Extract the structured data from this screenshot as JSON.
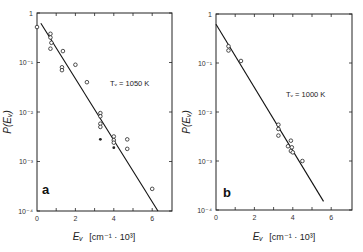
{
  "chart_data": [
    {
      "type": "scatter",
      "panel": "a",
      "annotation": "T_v = 1050 K",
      "xlabel": "E_v [cm^-1 · 10^3]",
      "ylabel": "P(E_v)",
      "xlim": [
        0,
        7
      ],
      "ylim": [
        0.0001,
        1
      ],
      "yscale": "log",
      "x_ticks": [
        "0",
        "2",
        "4",
        "6"
      ],
      "y_ticks": [
        "1",
        "10^-1",
        "10^-2",
        "10^-3",
        "10^-4"
      ],
      "grid": false,
      "points_open": [
        {
          "x": 0.0,
          "y": 0.52
        },
        {
          "x": 0.7,
          "y": 0.38
        },
        {
          "x": 0.7,
          "y": 0.32
        },
        {
          "x": 0.75,
          "y": 0.25
        },
        {
          "x": 0.7,
          "y": 0.19
        },
        {
          "x": 1.35,
          "y": 0.17
        },
        {
          "x": 1.3,
          "y": 0.08
        },
        {
          "x": 1.3,
          "y": 0.07
        },
        {
          "x": 2.0,
          "y": 0.09
        },
        {
          "x": 2.6,
          "y": 0.04
        },
        {
          "x": 3.3,
          "y": 0.0095
        },
        {
          "x": 3.3,
          "y": 0.0082
        },
        {
          "x": 3.3,
          "y": 0.0058
        },
        {
          "x": 3.3,
          "y": 0.005
        },
        {
          "x": 4.0,
          "y": 0.0032
        },
        {
          "x": 4.0,
          "y": 0.0027
        },
        {
          "x": 4.0,
          "y": 0.0024
        },
        {
          "x": 4.7,
          "y": 0.0028
        },
        {
          "x": 4.7,
          "y": 0.0018
        },
        {
          "x": 6.0,
          "y": 0.00028
        }
      ],
      "points_filled": [
        {
          "x": 3.3,
          "y": 0.0028
        },
        {
          "x": 4.0,
          "y": 0.0019
        }
      ],
      "fit_line": {
        "x": [
          0.2,
          6.3
        ],
        "y": [
          0.62,
          0.0001
        ]
      }
    },
    {
      "type": "scatter",
      "panel": "b",
      "annotation": "T_v = 1000 K",
      "xlabel": "E_v [cm^-1 · 10^3]",
      "ylabel": "P(E_v)",
      "xlim": [
        0,
        7
      ],
      "ylim": [
        0.0001,
        1
      ],
      "yscale": "log",
      "x_ticks": [
        "0",
        "2",
        "4",
        "6"
      ],
      "y_ticks": [
        "1",
        "10^-1",
        "10^-2",
        "10^-3",
        "10^-4"
      ],
      "grid": false,
      "points_open": [
        {
          "x": 0.65,
          "y": 0.22
        },
        {
          "x": 0.65,
          "y": 0.18
        },
        {
          "x": 1.3,
          "y": 0.11
        },
        {
          "x": 3.25,
          "y": 0.0055
        },
        {
          "x": 3.25,
          "y": 0.0045
        },
        {
          "x": 3.25,
          "y": 0.0033
        },
        {
          "x": 3.75,
          "y": 0.002
        },
        {
          "x": 3.9,
          "y": 0.0026
        },
        {
          "x": 3.95,
          "y": 0.0019
        },
        {
          "x": 3.9,
          "y": 0.0016
        },
        {
          "x": 4.0,
          "y": 0.0015
        },
        {
          "x": 4.5,
          "y": 0.001
        }
      ],
      "points_filled": [],
      "fit_line": {
        "x": [
          0.0,
          5.6
        ],
        "y": [
          0.62,
          0.00015
        ]
      }
    }
  ],
  "panels": {
    "a": {
      "label": "a",
      "annotation": "Tᵥ = 1050 K",
      "ylabel": "P(Eᵥ)",
      "xlabel_main": "Eᵥ",
      "xlabel_unit": "[cm⁻¹ · 10³]",
      "x_tick_labels": [
        "0",
        "2",
        "4",
        "6"
      ],
      "y_tick_labels": [
        "1",
        "10⁻¹",
        "10⁻²",
        "10⁻³",
        "10⁻⁴"
      ]
    },
    "b": {
      "label": "b",
      "annotation": "Tᵥ = 1000 K",
      "ylabel": "P(Eᵥ)",
      "xlabel_main": "Eᵥ",
      "xlabel_unit": "[cm⁻¹ · 10³]",
      "x_tick_labels": [
        "0",
        "2",
        "4",
        "6"
      ],
      "y_tick_labels": [
        "1",
        "10⁻¹",
        "10⁻²",
        "10⁻³",
        "10⁻⁴"
      ]
    }
  }
}
